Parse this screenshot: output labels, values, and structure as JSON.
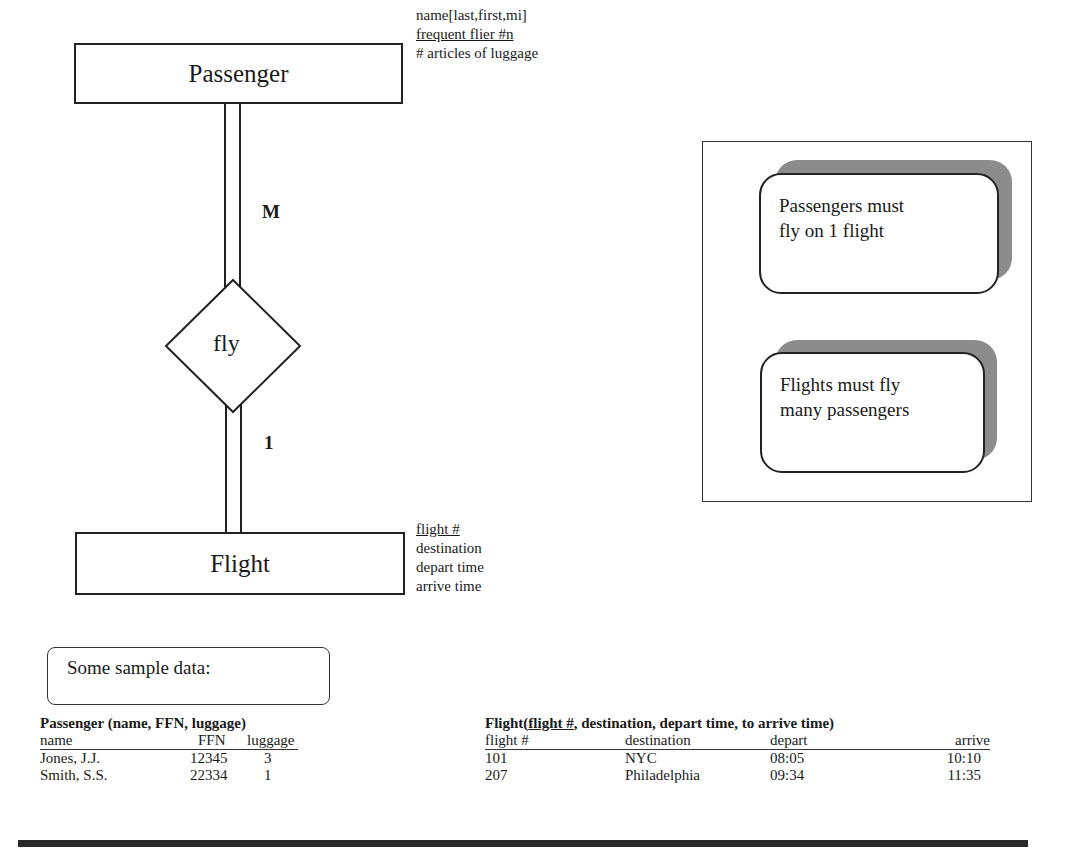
{
  "diagram": {
    "entities": {
      "passenger": {
        "label": "Passenger",
        "attributes": [
          {
            "text": "name[last,first,mi]",
            "key": false
          },
          {
            "text": "frequent flier #n",
            "key": true
          },
          {
            "text": "# articles of luggage",
            "key": false
          }
        ]
      },
      "flight": {
        "label": "Flight",
        "attributes": [
          {
            "text": "flight #",
            "key": true
          },
          {
            "text": "destination",
            "key": false
          },
          {
            "text": "depart time",
            "key": false
          },
          {
            "text": "arrive time",
            "key": false
          }
        ]
      }
    },
    "relationship": {
      "label": "fly",
      "cardinality_passenger_side": "M",
      "cardinality_flight_side": "1"
    },
    "notes": [
      {
        "line1": "Passengers must",
        "line2": "fly on 1 flight"
      },
      {
        "line1": "Flights must fly",
        "line2": "many passengers"
      }
    ]
  },
  "sample": {
    "heading": "Some sample data:",
    "passenger_table": {
      "title": "Passenger (name, FFN, luggage)",
      "columns": [
        "name",
        "FFN",
        "luggage"
      ],
      "rows": [
        [
          "Jones, J.J.",
          "12345",
          "3"
        ],
        [
          "Smith, S.S.",
          "22334",
          "1"
        ]
      ]
    },
    "flight_table": {
      "title_prefix": "Flight(",
      "title_key": "flight #",
      "title_suffix": ", destination, depart time, to arrive time)",
      "columns": [
        "flight #",
        "destination",
        "depart",
        "arrive"
      ],
      "rows": [
        [
          "101",
          "NYC",
          "08:05",
          "10:10"
        ],
        [
          "207",
          "Philadelphia",
          "09:34",
          "11:35"
        ]
      ]
    }
  }
}
